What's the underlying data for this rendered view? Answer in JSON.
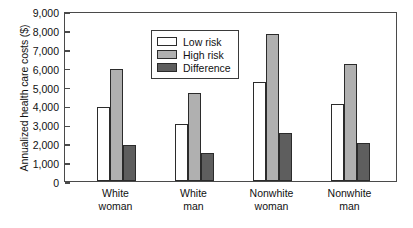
{
  "chart_data": {
    "type": "bar",
    "title": "",
    "xlabel": "",
    "ylabel": "Annualized health care costs ($)",
    "ylim": [
      0,
      9000
    ],
    "ytick_step": 1000,
    "grid": false,
    "legend_position": "top-left-inside",
    "categories": [
      "White woman",
      "White man",
      "Nonwhite woman",
      "Nonwhite man"
    ],
    "category_lines": [
      {
        "line1": "White",
        "line2": "woman"
      },
      {
        "line1": "White",
        "line2": "man"
      },
      {
        "line1": "Nonwhite",
        "line2": "woman"
      },
      {
        "line1": "Nonwhite",
        "line2": "man"
      }
    ],
    "ytick_labels": [
      "9,000",
      "8,000",
      "7,000",
      "6,000",
      "5,000",
      "4,000",
      "3,000",
      "2,000",
      "1,000",
      "0"
    ],
    "ytick_values": [
      9000,
      8000,
      7000,
      6000,
      5000,
      4000,
      3000,
      2000,
      1000,
      0
    ],
    "series": [
      {
        "name": "Low risk",
        "color": "#ffffff",
        "values": [
          3900,
          3000,
          5250,
          4100
        ]
      },
      {
        "name": "High risk",
        "color": "#b0b0b0",
        "values": [
          5950,
          4650,
          7800,
          6200
        ]
      },
      {
        "name": "Difference",
        "color": "#5e5e5e",
        "values": [
          1900,
          1500,
          2550,
          2000
        ]
      }
    ]
  },
  "legend": {
    "items": [
      {
        "label": "Low risk",
        "swatch": "low"
      },
      {
        "label": "High risk",
        "swatch": "high"
      },
      {
        "label": "Difference",
        "swatch": "diff"
      }
    ]
  }
}
